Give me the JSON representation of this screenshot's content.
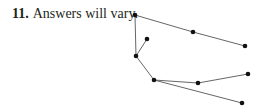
{
  "exercise": {
    "number": "11.",
    "text": "Answers will vary."
  },
  "graph": {
    "type": "tree",
    "edge_color": "#555555",
    "node_color": "#111111",
    "nodes": [
      {
        "id": "a",
        "x": 135,
        "y": 15
      },
      {
        "id": "b",
        "x": 193,
        "y": 32
      },
      {
        "id": "c",
        "x": 245,
        "y": 46
      },
      {
        "id": "d",
        "x": 147,
        "y": 39
      },
      {
        "id": "e",
        "x": 136,
        "y": 56
      },
      {
        "id": "f",
        "x": 154,
        "y": 80
      },
      {
        "id": "g",
        "x": 198,
        "y": 83
      },
      {
        "id": "h",
        "x": 248,
        "y": 74
      },
      {
        "id": "i",
        "x": 242,
        "y": 103
      }
    ],
    "edges": [
      [
        "a",
        "b"
      ],
      [
        "b",
        "c"
      ],
      [
        "a",
        "e"
      ],
      [
        "e",
        "d"
      ],
      [
        "e",
        "f"
      ],
      [
        "f",
        "g"
      ],
      [
        "g",
        "h"
      ],
      [
        "f",
        "i"
      ]
    ]
  }
}
